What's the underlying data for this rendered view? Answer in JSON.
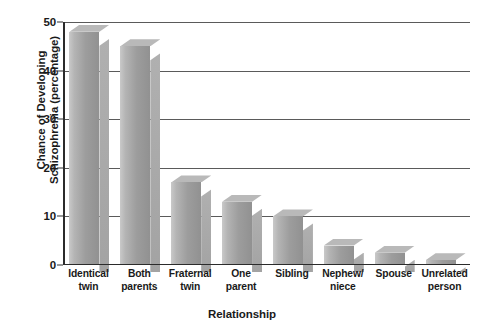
{
  "chart_data": {
    "type": "bar",
    "title": "",
    "subtitle": "",
    "xlabel": "Relationship",
    "ylabel": "Chance of Developing Schizophrenia (percentage)",
    "ylabel_lines": [
      "Chance of Developing",
      "Schizophrenia (percentage)"
    ],
    "categories": [
      "Identical twin",
      "Both parents",
      "Fraternal twin",
      "One parent",
      "Sibling",
      "Nephew/ niece",
      "Spouse",
      "Unrelated person"
    ],
    "category_lines": [
      [
        "Identical",
        "twin"
      ],
      [
        "Both",
        "parents"
      ],
      [
        "Fraternal",
        "twin"
      ],
      [
        "One",
        "parent"
      ],
      [
        "Sibling",
        ""
      ],
      [
        "Nephew/",
        "niece"
      ],
      [
        "Spouse",
        ""
      ],
      [
        "Unrelated",
        "person"
      ]
    ],
    "values": [
      48,
      45,
      17,
      13,
      10,
      4,
      2.5,
      1
    ],
    "ylim": [
      0,
      50
    ],
    "yticks": [
      0,
      10,
      20,
      30,
      40,
      50
    ],
    "ytick_labels": [
      "0",
      "10",
      "20",
      "30",
      "40",
      "50"
    ],
    "grid": true,
    "grid_axis": "y",
    "legend": false,
    "legend_position": "none",
    "bar_style": "3d",
    "bar_color": "#9d9d9d",
    "bar_highlight_color": "#c9c9c9",
    "bar_top_color": "#b9b9b9",
    "bar_side_color": "#b0b0b0",
    "grid_color": "#5a5a5a",
    "axis_color": "#2b2b2b",
    "text_color": "#1a1a1a",
    "background_color": "#ffffff"
  }
}
